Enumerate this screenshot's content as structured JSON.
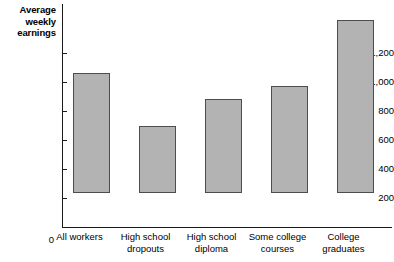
{
  "chart_data": {
    "type": "bar",
    "title": "",
    "xlabel": "",
    "ylabel": "Average weekly earnings",
    "ylabel_lines": [
      "Average",
      "weekly",
      "earnings"
    ],
    "categories": [
      "All workers",
      "High school dropouts",
      "High school diploma",
      "Some college courses",
      "College graduates"
    ],
    "category_lines": [
      [
        "All workers"
      ],
      [
        "High school",
        "dropouts"
      ],
      [
        "High school",
        "diploma"
      ],
      [
        "Some college",
        "courses"
      ],
      [
        "College",
        "graduates"
      ]
    ],
    "values": [
      830,
      460,
      650,
      735,
      1190
    ],
    "ylim": [
      0,
      1200
    ],
    "ytick_values": [
      0,
      200,
      400,
      600,
      800,
      1000,
      1200
    ],
    "ytick_labels": [
      "0",
      "200",
      "400",
      "600",
      "800",
      "1,000",
      "$1,200"
    ],
    "grid": false,
    "legend": false,
    "bar_fill_color": "#b3b3b3",
    "bar_border_color": "#4d4d4d",
    "axis_color": "#1a1a1a",
    "background_color": "#ffffff"
  }
}
